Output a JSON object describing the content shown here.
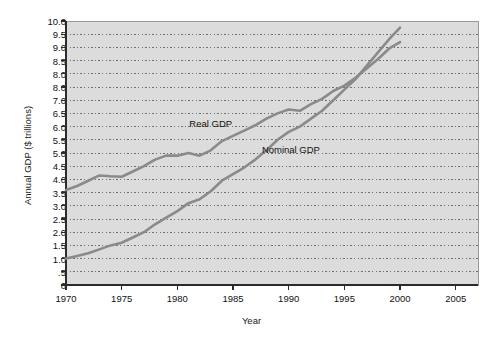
{
  "chart_data": {
    "type": "line",
    "title": "",
    "xlabel": "Year",
    "ylabel": "Annual GDP ($ trillions)",
    "xlim": [
      1970,
      2007
    ],
    "ylim": [
      0,
      10.0
    ],
    "grid": "horizontal-dotted",
    "legend_position": "inline-annotations",
    "x_ticks": [
      1970,
      1975,
      1980,
      1985,
      1990,
      1995,
      2000,
      2005
    ],
    "x_tick_labels": [
      "1970",
      "1975",
      "1980",
      "1985",
      "1990",
      "1995",
      "2000",
      "2005"
    ],
    "y_ticks": [
      0,
      0.5,
      1.0,
      1.5,
      2.0,
      2.5,
      3.0,
      3.5,
      4.0,
      4.5,
      5.0,
      5.5,
      6.0,
      6.5,
      7.0,
      7.5,
      8.0,
      8.5,
      9.0,
      9.5,
      10.0
    ],
    "y_tick_labels": [
      "0",
      ".5",
      "1.0",
      "1.5",
      "2.0",
      "2.5",
      "3.0",
      "3.5",
      "4.0",
      "4.5",
      "5.0",
      "5.5",
      "6.0",
      "6.5",
      "7.0",
      "8.0",
      "8.0",
      "8.5",
      "9.0",
      "9.5",
      "10.0"
    ],
    "y_tick_label_note": "As printed in the source figure: the 7.5 gridline is mislabeled '8.0', so '8.0' appears twice.",
    "series": [
      {
        "name": "Real GDP",
        "label_x": 1983.0,
        "label_y": 6.15,
        "color": "#8a8a8a",
        "x": [
          1970,
          1971,
          1972,
          1973,
          1974,
          1975,
          1976,
          1977,
          1978,
          1979,
          1980,
          1981,
          1982,
          1983,
          1984,
          1985,
          1986,
          1987,
          1988,
          1989,
          1990,
          1991,
          1992,
          1993,
          1994,
          1995,
          1996,
          1997,
          1998,
          1999,
          2000
        ],
        "values": [
          3.6,
          3.75,
          3.95,
          4.15,
          4.12,
          4.1,
          4.3,
          4.5,
          4.75,
          4.9,
          4.9,
          5.0,
          4.9,
          5.1,
          5.45,
          5.65,
          5.85,
          6.05,
          6.3,
          6.5,
          6.65,
          6.6,
          6.85,
          7.05,
          7.35,
          7.55,
          7.85,
          8.2,
          8.55,
          8.95,
          9.2
        ]
      },
      {
        "name": "Nominal GDP",
        "label_x": 1990.2,
        "label_y": 5.15,
        "color": "#8a8a8a",
        "x": [
          1970,
          1971,
          1972,
          1973,
          1974,
          1975,
          1976,
          1977,
          1978,
          1979,
          1980,
          1981,
          1982,
          1983,
          1984,
          1985,
          1986,
          1987,
          1988,
          1989,
          1990,
          1991,
          1992,
          1993,
          1994,
          1995,
          1996,
          1997,
          1998,
          1999,
          2000
        ],
        "values": [
          1.0,
          1.1,
          1.2,
          1.35,
          1.5,
          1.6,
          1.8,
          2.0,
          2.3,
          2.55,
          2.8,
          3.1,
          3.25,
          3.55,
          3.95,
          4.2,
          4.45,
          4.75,
          5.1,
          5.5,
          5.8,
          6.0,
          6.3,
          6.6,
          7.0,
          7.4,
          7.8,
          8.3,
          8.8,
          9.3,
          9.75
        ]
      }
    ]
  }
}
